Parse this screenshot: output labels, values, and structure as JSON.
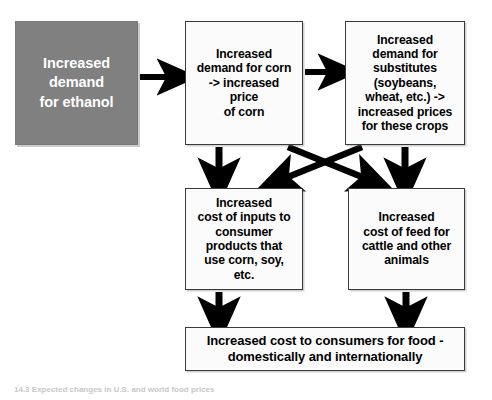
{
  "diagram": {
    "colors": {
      "source_box_fill": "#808080",
      "source_box_text": "#ffffff",
      "box_fill": "#fbfbfb",
      "box_border": "#3a3a3a",
      "box_text": "#000000",
      "arrow": "#000000",
      "background": "#ffffff"
    },
    "nodes": [
      {
        "id": "ethanol",
        "label": "Increased\ndemand\nfor ethanol",
        "style": "filled"
      },
      {
        "id": "corn",
        "label": "Increased\ndemand for corn\n-> increased\nprice\nof corn",
        "style": "plain"
      },
      {
        "id": "substitutes",
        "label": "Increased\ndemand for\nsubstitutes\n(soybeans,\nwheat, etc.) ->\nincreased prices\nfor these crops",
        "style": "plain"
      },
      {
        "id": "inputs",
        "label": "Increased\ncost of inputs to\nconsumer\nproducts that\nuse corn, soy,\netc.",
        "style": "plain"
      },
      {
        "id": "feed",
        "label": "Increased\ncost of feed for\ncattle and other\nanimals",
        "style": "plain"
      },
      {
        "id": "consumers",
        "label": "Increased cost to consumers for food -\ndomestically and internationally",
        "style": "plain"
      }
    ],
    "edges": [
      {
        "id": "ethanol-to-corn",
        "from": "ethanol",
        "to": "corn",
        "direction": "right"
      },
      {
        "id": "corn-to-substitutes",
        "from": "corn",
        "to": "substitutes",
        "direction": "right"
      },
      {
        "id": "corn-to-inputs",
        "from": "corn",
        "to": "inputs",
        "direction": "down"
      },
      {
        "id": "substitutes-to-feed",
        "from": "substitutes",
        "to": "feed",
        "direction": "down"
      },
      {
        "id": "corn-to-feed",
        "from": "corn",
        "to": "feed",
        "direction": "diagonal-down-right"
      },
      {
        "id": "substitutes-to-inputs",
        "from": "substitutes",
        "to": "inputs",
        "direction": "diagonal-down-left"
      },
      {
        "id": "inputs-to-consumers",
        "from": "inputs",
        "to": "consumers",
        "direction": "down"
      },
      {
        "id": "feed-to-consumers",
        "from": "feed",
        "to": "consumers",
        "direction": "down"
      }
    ],
    "caption": "14.3 Expected changes in U.S. and world food prices"
  }
}
